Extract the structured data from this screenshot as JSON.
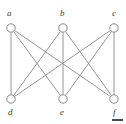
{
  "figure": {
    "type": "graph-diagram",
    "name": "complete-bipartite-graph-k33",
    "width": 126,
    "height": 124,
    "background_color": "#ffffff",
    "edge_color": "#8a8a8a",
    "node_stroke_color": "#8a8a8a",
    "node_fill_color": "#ffffff",
    "label_color": "#3a3a3a",
    "corner_mark_color": "#4a4a4a"
  },
  "nodes": [
    {
      "id": "a",
      "label": "a",
      "x": 11,
      "y": 28,
      "r": 4.2,
      "label_x": 7,
      "label_y": 9,
      "row": "top"
    },
    {
      "id": "b",
      "label": "b",
      "x": 63,
      "y": 28,
      "r": 4.2,
      "label_x": 60,
      "label_y": 9,
      "row": "top"
    },
    {
      "id": "c",
      "label": "c",
      "x": 114,
      "y": 28,
      "r": 4.2,
      "label_x": 112,
      "label_y": 9,
      "row": "top"
    },
    {
      "id": "d",
      "label": "d",
      "x": 11,
      "y": 99,
      "r": 4.2,
      "label_x": 8,
      "label_y": 108,
      "row": "bottom"
    },
    {
      "id": "e",
      "label": "e",
      "x": 63,
      "y": 99,
      "r": 4.2,
      "label_x": 60,
      "label_y": 108,
      "row": "bottom"
    },
    {
      "id": "f",
      "label": "f",
      "x": 114,
      "y": 99,
      "r": 4.2,
      "label_x": 113,
      "label_y": 108,
      "row": "bottom"
    }
  ],
  "edges": [
    {
      "from": "a",
      "to": "d"
    },
    {
      "from": "a",
      "to": "e"
    },
    {
      "from": "a",
      "to": "f"
    },
    {
      "from": "b",
      "to": "d"
    },
    {
      "from": "b",
      "to": "e"
    },
    {
      "from": "b",
      "to": "f"
    },
    {
      "from": "c",
      "to": "d"
    },
    {
      "from": "c",
      "to": "e"
    },
    {
      "from": "c",
      "to": "f"
    }
  ],
  "corner_mark": {
    "x": 112,
    "y": 119,
    "width": 11,
    "height": 2
  }
}
